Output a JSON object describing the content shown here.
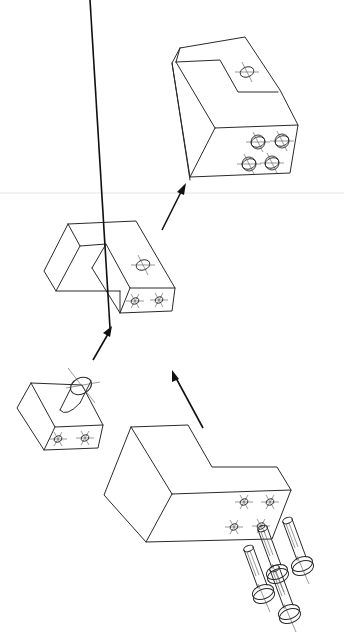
{
  "figure": {
    "colors": {
      "line": "#2a2a2a",
      "arrow": "#111111",
      "background": "#ffffff",
      "rule": "#e6e6e6"
    },
    "parts": [
      {
        "id": "final-assembly",
        "label": "Final assembled block with 4 bolt heads"
      },
      {
        "id": "intermediate-block",
        "label": "Notched block with 2 holes"
      },
      {
        "id": "pin-block",
        "label": "Small block with cylindrical pin"
      },
      {
        "id": "l-block",
        "label": "L-shaped base block with 4 holes"
      },
      {
        "id": "bolts",
        "label": "Four bolts",
        "count": 4
      }
    ],
    "arrows": [
      {
        "from": "intermediate-block",
        "to": "final-assembly"
      },
      {
        "from": "pin-block",
        "to": "intermediate-block"
      },
      {
        "from": "l-block",
        "to": "intermediate-block"
      }
    ]
  }
}
